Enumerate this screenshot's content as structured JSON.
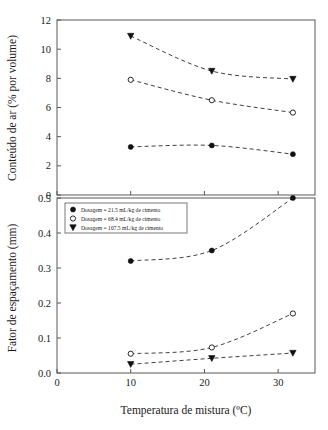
{
  "chart_data": [
    {
      "panel": "top",
      "type": "line",
      "title": "",
      "xlabel": "",
      "ylabel": "Conteúdo de ar (% por volume)",
      "x": [
        10,
        21,
        32
      ],
      "xlim": [
        0,
        35
      ],
      "ylim": [
        0,
        12
      ],
      "xticks": [
        0,
        10,
        20,
        30
      ],
      "yticks": [
        0,
        2,
        4,
        6,
        8,
        10,
        12
      ],
      "xticklabels": [
        "0",
        "10",
        "20",
        "30"
      ],
      "yticklabels": [
        "0",
        "2",
        "4",
        "6",
        "8",
        "10",
        "12"
      ],
      "grid": false,
      "legend_position": "none",
      "series": [
        {
          "name": "Dosagem = 21.5 mL/kg de cimento",
          "marker": "filled-circle",
          "values": [
            3.3,
            3.4,
            2.8
          ]
        },
        {
          "name": "Dosagem = 68.4 mL/kg de cimento",
          "marker": "open-circle",
          "values": [
            7.9,
            6.5,
            5.65
          ]
        },
        {
          "name": "Dosagem = 107.5 mL/kg de cimento",
          "marker": "filled-triangle",
          "values": [
            10.9,
            8.5,
            7.95
          ]
        }
      ]
    },
    {
      "panel": "bottom",
      "type": "line",
      "title": "",
      "xlabel": "Temperatura de mistura (ºC)",
      "ylabel": "Fator de espaçamento (mm)",
      "x": [
        10,
        21,
        32
      ],
      "xlim": [
        0,
        35
      ],
      "ylim": [
        0.0,
        0.5
      ],
      "xticks": [
        0,
        10,
        20,
        30
      ],
      "yticks": [
        0.0,
        0.1,
        0.2,
        0.3,
        0.4,
        0.5
      ],
      "xticklabels": [
        "0",
        "10",
        "20",
        "30"
      ],
      "yticklabels": [
        "0.0",
        "0.1",
        "0.2",
        "0.3",
        "0.4",
        "0.5"
      ],
      "grid": false,
      "legend_position": "top-left",
      "series": [
        {
          "name": "Dosagem = 21.5 mL/kg de cimento",
          "marker": "filled-circle",
          "values": [
            0.32,
            0.35,
            0.5
          ]
        },
        {
          "name": "Dosagem = 68.4 mL/kg de cimento",
          "marker": "open-circle",
          "values": [
            0.055,
            0.073,
            0.17
          ]
        },
        {
          "name": "Dosagem = 107.5 mL/kg de cimento",
          "marker": "filled-triangle",
          "values": [
            0.025,
            0.042,
            0.057
          ]
        }
      ]
    }
  ],
  "legend": {
    "entries": [
      {
        "marker": "filled-circle",
        "label": "Dosagem = 21.5 mL/kg de cimento"
      },
      {
        "marker": "open-circle",
        "label": "Dosagem = 68.4 mL/kg de cimento"
      },
      {
        "marker": "filled-triangle",
        "label": "Dosagem = 107.5 mL/kg de cimento"
      }
    ]
  },
  "colors": {
    "ink": "#111111",
    "axis": "#585858",
    "background": "#ffffff"
  }
}
